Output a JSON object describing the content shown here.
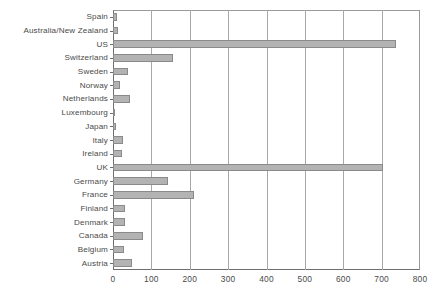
{
  "chart_data": {
    "type": "bar",
    "orientation": "horizontal",
    "title": "",
    "subtitle": "",
    "xlabel": "",
    "ylabel": "",
    "xlim": [
      0,
      800
    ],
    "ylim": null,
    "grid": true,
    "legend": false,
    "legend_position": "none",
    "xticks": [
      "0",
      "100",
      "200",
      "300",
      "400",
      "500",
      "600",
      "700",
      "800"
    ],
    "xtick_values": [
      0,
      100,
      200,
      300,
      400,
      500,
      600,
      700,
      800
    ],
    "categories": [
      "Spain",
      "Australia/New Zealand",
      "US",
      "Switzerland",
      "Sweden",
      "Norway",
      "Netherlands",
      "Luxembourg",
      "Japan",
      "Italy",
      "Ireland",
      "UK",
      "Germany",
      "France",
      "Finland",
      "Denmark",
      "Canada",
      "Belgium",
      "Austria"
    ],
    "values": [
      10,
      14,
      737,
      156,
      40,
      18,
      45,
      6,
      8,
      26,
      24,
      703,
      143,
      211,
      30,
      32,
      78,
      28,
      50
    ],
    "bar_color": "#b3b3b3",
    "bar_border_color": "#8a8a8a",
    "grid_color": "#a8a8a8",
    "axis_color": "#6e6e6e",
    "background_color": "#ffffff",
    "text_color": "#4a4a4a"
  }
}
